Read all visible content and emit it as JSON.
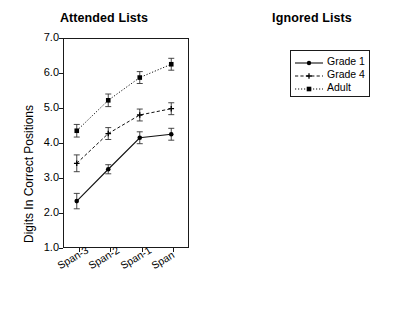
{
  "figure": {
    "background": "#ffffff",
    "axis_color": "#1a1a1a",
    "ylabel": "Digits In Correct Positions"
  },
  "legend": {
    "position": "upper-left of right panel",
    "entries": [
      {
        "label": "Grade 1",
        "line": "solid",
        "marker": "circle"
      },
      {
        "label": "Grade 4",
        "line": "dashed",
        "marker": "plus"
      },
      {
        "label": "Adult",
        "line": "dotted",
        "marker": "square"
      }
    ]
  },
  "yticks": [
    "7.0",
    "6.0",
    "5.0",
    "4.0",
    "3.0",
    "2.0",
    "1.0"
  ],
  "xticks": [
    "Span-3",
    "Span-2",
    "Span-1",
    "Span"
  ],
  "chart_data": [
    {
      "type": "line",
      "title": "Attended Lists",
      "xlabel": "",
      "ylabel": "Digits In Correct Positions",
      "categories": [
        "Span-3",
        "Span-2",
        "Span-1",
        "Span"
      ],
      "ylim": [
        1.0,
        7.0
      ],
      "ytick_step": 1.0,
      "grid": false,
      "legend": "none",
      "series": [
        {
          "name": "Grade 1",
          "line": "solid",
          "marker": "circle",
          "values": [
            2.34,
            3.25,
            4.15,
            4.25
          ],
          "errors": [
            0.22,
            0.13,
            0.17,
            0.17
          ]
        },
        {
          "name": "Grade 4",
          "line": "dashed",
          "marker": "plus",
          "values": [
            3.42,
            4.27,
            4.8,
            4.98
          ],
          "errors": [
            0.24,
            0.17,
            0.17,
            0.17
          ]
        },
        {
          "name": "Adult",
          "line": "dotted",
          "marker": "square",
          "values": [
            4.35,
            5.22,
            5.87,
            6.25
          ],
          "errors": [
            0.18,
            0.18,
            0.17,
            0.17
          ]
        }
      ]
    },
    {
      "type": "line",
      "title": "Ignored Lists",
      "xlabel": "",
      "ylabel": "Digits In Correct Positions",
      "categories": [
        "Span-3",
        "Span-2",
        "Span-1",
        "Span"
      ],
      "ylim": [
        1.0,
        7.0
      ],
      "ytick_step": 1.0,
      "grid": false,
      "legend": "upper-left",
      "series": [
        {
          "name": "Grade 1",
          "line": "solid",
          "marker": "circle",
          "values": [
            2.12,
            2.62,
            2.66,
            2.06
          ],
          "errors": [
            0.19,
            0.19,
            0.21,
            0.21
          ]
        },
        {
          "name": "Grade 4",
          "line": "dashed",
          "marker": "plus",
          "values": [
            2.84,
            3.25,
            3.2,
            3.06
          ],
          "errors": [
            0.19,
            0.19,
            0.19,
            0.24
          ]
        },
        {
          "name": "Adult",
          "line": "dotted",
          "marker": "square",
          "values": [
            3.47,
            3.64,
            3.82,
            3.33
          ],
          "errors": [
            0.16,
            0.19,
            0.19,
            0.16
          ]
        }
      ]
    }
  ]
}
